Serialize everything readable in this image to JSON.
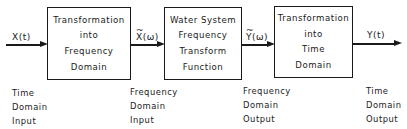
{
  "diagram": {
    "type": "block-flow",
    "blocks": [
      {
        "lines": [
          "Transformation",
          "into",
          "Frequency",
          "Domain"
        ]
      },
      {
        "lines": [
          "Water System",
          "Frequency",
          "Transform",
          "Function"
        ]
      },
      {
        "lines": [
          "Transformation",
          "into",
          "Time",
          "Domain"
        ]
      }
    ],
    "signals": [
      {
        "pre": "",
        "symbol": "X",
        "arg": "(t)",
        "tilde": false
      },
      {
        "pre": "",
        "symbol": "X",
        "arg": "(ω)",
        "tilde": true
      },
      {
        "pre": "",
        "symbol": "Y",
        "arg": "(ω)",
        "tilde": true
      },
      {
        "pre": "",
        "symbol": "Y",
        "arg": "(t)",
        "tilde": false
      }
    ],
    "labels": [
      {
        "lines": [
          "Time",
          "Domain",
          "Input"
        ]
      },
      {
        "lines": [
          "Frequency",
          "Domain",
          "Input"
        ]
      },
      {
        "lines": [
          "Frequency",
          "Domain",
          "Output"
        ]
      },
      {
        "lines": [
          "Time",
          "Domain",
          "Output"
        ]
      }
    ]
  }
}
